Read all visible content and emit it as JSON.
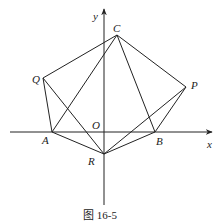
{
  "figure": {
    "caption": "图 16-5",
    "axes": {
      "x_label": "x",
      "y_label": "y",
      "origin_label": "O"
    },
    "points": [
      {
        "name": "C",
        "label": "C",
        "px": [
          117,
          35
        ]
      },
      {
        "name": "Q",
        "label": "Q",
        "px": [
          43,
          78
        ]
      },
      {
        "name": "P",
        "label": "P",
        "px": [
          186,
          87
        ]
      },
      {
        "name": "A",
        "label": "A",
        "px": [
          52,
          132
        ]
      },
      {
        "name": "B",
        "label": "B",
        "px": [
          155,
          132
        ]
      },
      {
        "name": "R",
        "label": "R",
        "px": [
          104,
          154
        ]
      }
    ],
    "segments": [
      [
        "Q",
        "C"
      ],
      [
        "C",
        "P"
      ],
      [
        "Q",
        "A"
      ],
      [
        "P",
        "B"
      ],
      [
        "A",
        "C"
      ],
      [
        "C",
        "B"
      ],
      [
        "Q",
        "R"
      ],
      [
        "P",
        "R"
      ],
      [
        "A",
        "R"
      ],
      [
        "B",
        "R"
      ],
      [
        "A",
        "B"
      ]
    ],
    "colors": {
      "line": "#222222",
      "background": "#ffffff"
    }
  }
}
